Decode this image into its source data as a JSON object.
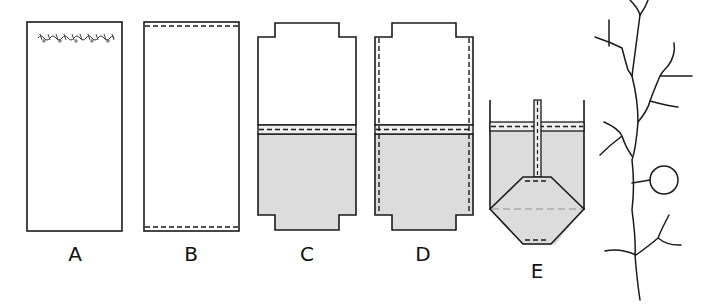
{
  "diagram": {
    "colors": {
      "stroke": "#1a1a1a",
      "fill_shaded": "#dcdcdc",
      "background": "#ffffff",
      "dash_light": "#888888"
    },
    "panels": [
      {
        "id": "A",
        "label": "A",
        "description": "Tall rectangle with a decorative stitched/embroidered line along the top edge"
      },
      {
        "id": "B",
        "label": "B",
        "description": "Tall rectangle with dashed seam lines along top and bottom edges"
      },
      {
        "id": "C",
        "label": "C",
        "description": "Rectangle with notched top and bottom tabs; lower half shaded with a double fold line and dashed seam"
      },
      {
        "id": "D",
        "label": "D",
        "description": "Same as C with additional dashed seams along both side edges"
      },
      {
        "id": "E",
        "label": "E",
        "description": "Container cross-section with shaded lower region, central vertical tube, and an octagonal/hexagonal shape with dashed seams"
      }
    ],
    "tree": {
      "description": "Vertical branching line drawing with several side branches and a circle attached on the right",
      "has_circle": true
    }
  }
}
